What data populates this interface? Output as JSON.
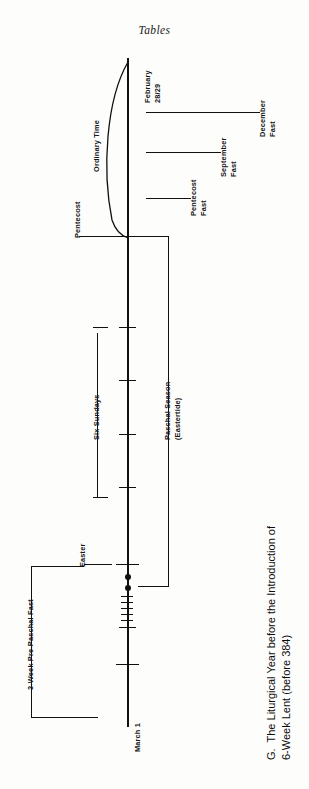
{
  "page": {
    "header": "Tables",
    "caption": "G.  The Liturgical Year before the Introduction of\n6-Week Lent (before 384)"
  },
  "diagram": {
    "type": "timeline",
    "orientation": "vertical-rotated",
    "axis": {
      "start_label": "February 28/29",
      "end_label": "March 1"
    },
    "labels": {
      "ordinary_time": "Ordinary Time",
      "pentecost": "Pentecost",
      "pentecost_fast": "Pentecost\nFast",
      "september_fast": "September\nFast",
      "december_fast": "December\nFast",
      "paschal_season": "Paschal Season\n(Eastertide)",
      "six_sundays": "Six Sundays",
      "easter": "Easter",
      "pre_paschal_fast": "3-Week Pre-Paschal Fast",
      "february": "February",
      "february_days": "28/29",
      "march_one": "March 1"
    },
    "fast_lines": [
      {
        "name": "december-fast",
        "label_line1": "December",
        "label_line2": "Fast"
      },
      {
        "name": "september-fast",
        "label_line1": "September",
        "label_line2": "Fast"
      },
      {
        "name": "pentecost-fast",
        "label_line1": "Pentecost",
        "label_line2": "Fast"
      }
    ],
    "brackets": [
      {
        "name": "paschal-season",
        "label_line1": "Paschal Season",
        "label_line2": "(Eastertide)"
      },
      {
        "name": "pre-paschal-fast",
        "label": "3-Week Pre-Paschal Fast"
      },
      {
        "name": "six-sundays",
        "label": "Six Sundays"
      },
      {
        "name": "ordinary-time",
        "label": "Ordinary Time"
      }
    ],
    "colors": {
      "ink": "#111111",
      "paper": "#fdfdfc"
    }
  }
}
